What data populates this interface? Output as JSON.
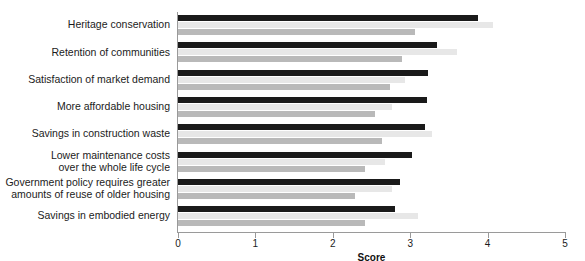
{
  "chart_data": {
    "type": "bar",
    "orientation": "horizontal",
    "title": "",
    "xlabel": "Score",
    "ylabel": "",
    "xlim": [
      0,
      5
    ],
    "xticks": [
      0,
      1,
      2,
      3,
      4,
      5
    ],
    "xtick_labels": [
      "0",
      "1",
      "2",
      "3",
      "4",
      "5"
    ],
    "grid": false,
    "legend": "none",
    "categories": [
      "Heritage conservation",
      "Retention of communities",
      "Satisfaction of market demand",
      "More affordable housing",
      "Savings in construction waste",
      "Lower maintenance costs over the whole life cycle",
      "Government policy requires greater amounts of reuse of older housing",
      "Savings in embodied energy"
    ],
    "category_lines": [
      [
        "Heritage conservation"
      ],
      [
        "Retention of communities"
      ],
      [
        "Satisfaction of market demand"
      ],
      [
        "More affordable housing"
      ],
      [
        "Savings in construction waste"
      ],
      [
        "Lower maintenance costs",
        "over the whole life cycle"
      ],
      [
        "Government policy requires greater",
        "amounts of reuse of older housing"
      ],
      [
        "Savings in embodied energy"
      ]
    ],
    "series": [
      {
        "name": "Series 1",
        "color": "#1a1a1a",
        "values": [
          3.88,
          3.35,
          3.23,
          3.22,
          3.19,
          3.02,
          2.87,
          2.8
        ]
      },
      {
        "name": "Series 2",
        "color": "#e7e7e7",
        "values": [
          4.07,
          3.6,
          2.93,
          2.76,
          3.28,
          2.67,
          2.76,
          3.1
        ]
      },
      {
        "name": "Series 3",
        "color": "#b9b9b9",
        "values": [
          3.06,
          2.9,
          2.74,
          2.55,
          2.64,
          2.42,
          2.29,
          2.42
        ]
      }
    ]
  }
}
